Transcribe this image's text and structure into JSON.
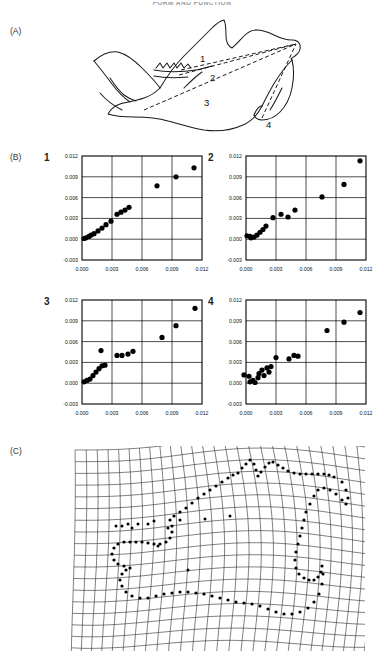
{
  "running_head": "FORM AND FUNCTION",
  "panels": {
    "a": {
      "label": "(A)",
      "name": "mandible-diagram",
      "measurement_labels": [
        "1",
        "2",
        "3",
        "4"
      ],
      "description": "Rodent mandible outline with four dashed in-lever/out-lever measurement lines converging on the condyle"
    },
    "b": {
      "label": "(B)",
      "name": "scatter-plot-grid"
    },
    "c": {
      "label": "(C)",
      "name": "deformation-grid",
      "description": "Thin-plate spline deformation grid with mandible landmark outline"
    }
  },
  "axis": {
    "x_ticks": [
      "0.000",
      "0.003",
      "0.006",
      "0.009",
      "0.012"
    ],
    "y_ticks": [
      "0.012",
      "0.009",
      "0.006",
      "0.003",
      "0.000",
      "-0.003"
    ],
    "xlim": [
      0.0,
      0.012
    ],
    "ylim": [
      -0.003,
      0.012
    ],
    "tick_step": 0.003
  },
  "chart_data": [
    {
      "type": "scatter",
      "id": "plot-1",
      "title": "1",
      "xlabel": "",
      "ylabel": "",
      "xlim": [
        0.0,
        0.012
      ],
      "ylim": [
        -0.003,
        0.012
      ],
      "xticks": [
        0.0,
        0.003,
        0.006,
        0.009,
        0.012
      ],
      "yticks": [
        -0.003,
        0.0,
        0.003,
        0.006,
        0.009,
        0.012
      ],
      "grid": true,
      "legend": null,
      "points": [
        [
          0.0002,
          0.0001
        ],
        [
          0.0004,
          0.0002
        ],
        [
          0.0007,
          0.0004
        ],
        [
          0.0009,
          0.0006
        ],
        [
          0.0012,
          0.0008
        ],
        [
          0.0016,
          0.0012
        ],
        [
          0.002,
          0.0016
        ],
        [
          0.0024,
          0.0021
        ],
        [
          0.0029,
          0.0026
        ],
        [
          0.0035,
          0.0036
        ],
        [
          0.0039,
          0.0039
        ],
        [
          0.0043,
          0.0042
        ],
        [
          0.0047,
          0.0046
        ],
        [
          0.0075,
          0.0077
        ],
        [
          0.0094,
          0.009
        ],
        [
          0.0112,
          0.0103
        ]
      ]
    },
    {
      "type": "scatter",
      "id": "plot-2",
      "title": "2",
      "xlabel": "",
      "ylabel": "",
      "xlim": [
        0.0,
        0.012
      ],
      "ylim": [
        -0.003,
        0.012
      ],
      "xticks": [
        0.0,
        0.003,
        0.006,
        0.009,
        0.012
      ],
      "yticks": [
        -0.003,
        0.0,
        0.003,
        0.006,
        0.009,
        0.012
      ],
      "grid": true,
      "legend": null,
      "points": [
        [
          0.0001,
          0.0005
        ],
        [
          0.0004,
          0.0004
        ],
        [
          0.0005,
          0.0002
        ],
        [
          0.0008,
          0.0003
        ],
        [
          0.0011,
          0.0006
        ],
        [
          0.0014,
          0.001
        ],
        [
          0.0017,
          0.0014
        ],
        [
          0.002,
          0.0019
        ],
        [
          0.0027,
          0.0031
        ],
        [
          0.0035,
          0.0036
        ],
        [
          0.0042,
          0.0032
        ],
        [
          0.0049,
          0.0042
        ],
        [
          0.0076,
          0.0061
        ],
        [
          0.0098,
          0.0079
        ],
        [
          0.0114,
          0.0113
        ]
      ]
    },
    {
      "type": "scatter",
      "id": "plot-3",
      "title": "3",
      "xlabel": "",
      "ylabel": "",
      "xlim": [
        0.0,
        0.012
      ],
      "ylim": [
        -0.003,
        0.012
      ],
      "xticks": [
        0.0,
        0.003,
        0.006,
        0.009,
        0.012
      ],
      "yticks": [
        -0.003,
        0.0,
        0.003,
        0.006,
        0.009,
        0.012
      ],
      "grid": true,
      "legend": null,
      "points": [
        [
          0.0002,
          0.0002
        ],
        [
          0.0005,
          0.0004
        ],
        [
          0.0008,
          0.0006
        ],
        [
          0.0011,
          0.0011
        ],
        [
          0.0014,
          0.0016
        ],
        [
          0.0017,
          0.0021
        ],
        [
          0.002,
          0.0025
        ],
        [
          0.0023,
          0.0026
        ],
        [
          0.0019,
          0.0047
        ],
        [
          0.0035,
          0.004
        ],
        [
          0.004,
          0.004
        ],
        [
          0.0046,
          0.0042
        ],
        [
          0.0051,
          0.0046
        ],
        [
          0.008,
          0.0066
        ],
        [
          0.0094,
          0.0083
        ],
        [
          0.0113,
          0.0108
        ]
      ]
    },
    {
      "type": "scatter",
      "id": "plot-4",
      "title": "4",
      "xlabel": "",
      "ylabel": "",
      "xlim": [
        0.0,
        0.012
      ],
      "ylim": [
        -0.003,
        0.012
      ],
      "xticks": [
        0.0,
        0.003,
        0.006,
        0.009,
        0.012
      ],
      "yticks": [
        -0.003,
        0.0,
        0.003,
        0.006,
        0.009,
        0.012
      ],
      "grid": true,
      "legend": null,
      "points": [
        [
          -0.0002,
          0.0012
        ],
        [
          0.0003,
          0.001
        ],
        [
          0.0004,
          0.0002
        ],
        [
          0.0007,
          0.0004
        ],
        [
          0.0009,
          0.0001
        ],
        [
          0.0012,
          0.0008
        ],
        [
          0.0013,
          0.0014
        ],
        [
          0.0016,
          0.0019
        ],
        [
          0.0018,
          0.0011
        ],
        [
          0.0021,
          0.0022
        ],
        [
          0.0023,
          0.0016
        ],
        [
          0.0025,
          0.0024
        ],
        [
          0.003,
          0.0037
        ],
        [
          0.0043,
          0.0035
        ],
        [
          0.0048,
          0.004
        ],
        [
          0.0052,
          0.0039
        ],
        [
          0.0081,
          0.0076
        ],
        [
          0.0098,
          0.0088
        ],
        [
          0.0114,
          0.0102
        ]
      ]
    }
  ]
}
